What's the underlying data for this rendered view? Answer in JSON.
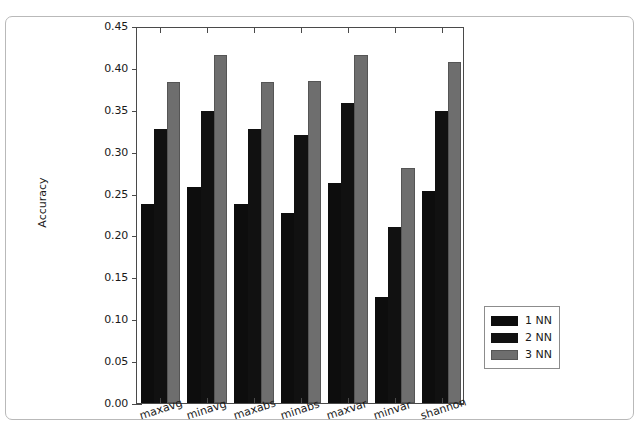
{
  "chart_data": {
    "type": "bar",
    "title": "",
    "xlabel": "",
    "ylabel": "Accuracy",
    "categories": [
      "maxavg",
      "minavg",
      "maxabs",
      "minabs",
      "maxvar",
      "minvar",
      "shannon"
    ],
    "series": [
      {
        "name": "1 NN",
        "color": "#0d0d0d",
        "values": [
          0.238,
          0.258,
          0.238,
          0.227,
          0.263,
          0.127,
          0.253
        ]
      },
      {
        "name": "2 NN",
        "color": "#111111",
        "values": [
          0.327,
          0.349,
          0.327,
          0.32,
          0.358,
          0.21,
          0.348
        ]
      },
      {
        "name": "3 NN",
        "color": "#6e6e6e",
        "values": [
          0.383,
          0.416,
          0.383,
          0.384,
          0.416,
          0.28,
          0.407
        ]
      }
    ],
    "ylim": [
      0.0,
      0.45
    ],
    "yticks": [
      "0.00",
      "0.05",
      "0.10",
      "0.15",
      "0.20",
      "0.25",
      "0.30",
      "0.35",
      "0.40",
      "0.45"
    ],
    "ytick_values": [
      0.0,
      0.05,
      0.1,
      0.15,
      0.2,
      0.25,
      0.3,
      0.35,
      0.4,
      0.45
    ],
    "grid": false,
    "legend_position": "right-outside",
    "legend_entries": [
      "1 NN",
      "2 NN",
      "3 NN"
    ]
  },
  "axes": {
    "ylabel": "Accuracy"
  }
}
